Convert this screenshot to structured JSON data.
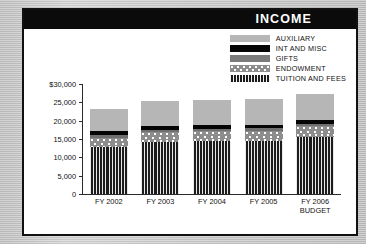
{
  "header": {
    "title": "INCOME"
  },
  "legend": {
    "items": [
      {
        "label": "AUXILIARY",
        "key": "aux",
        "color": "#b6b6b6"
      },
      {
        "label": "INT AND MISC",
        "key": "int",
        "color": "#050505"
      },
      {
        "label": "GIFTS",
        "key": "gift",
        "color": "#6f6f6f"
      },
      {
        "label": "ENDOWMENT",
        "key": "endow",
        "color": "#8d8d8d"
      },
      {
        "label": "TUITION AND FEES",
        "key": "tuition",
        "color": "#262626"
      }
    ]
  },
  "axis": {
    "y_ticks": [
      "$30,000",
      "25,000",
      "20,000",
      "15,000",
      "10,000",
      "5,000",
      "0"
    ]
  },
  "chart_data": {
    "type": "bar",
    "title": "INCOME",
    "xlabel": "",
    "ylabel": "",
    "ylim": [
      0,
      30000
    ],
    "grid": false,
    "stacked": true,
    "legend_position": "top-right",
    "categories": [
      "FY 2002",
      "FY 2003",
      "FY 2004",
      "FY 2005",
      "FY 2006 BUDGET"
    ],
    "category_lines": [
      [
        "FY 2002"
      ],
      [
        "FY 2003"
      ],
      [
        "FY 2004"
      ],
      [
        "FY 2005"
      ],
      [
        "FY 2006",
        "BUDGET"
      ]
    ],
    "series": [
      {
        "name": "TUITION AND FEES",
        "values": [
          12900,
          14300,
          14400,
          14400,
          15500
        ]
      },
      {
        "name": "ENDOWMENT",
        "values": [
          2500,
          2700,
          2800,
          2900,
          3100
        ]
      },
      {
        "name": "GIFTS",
        "values": [
          600,
          600,
          600,
          600,
          600
        ]
      },
      {
        "name": "INT AND MISC",
        "values": [
          1100,
          1000,
          1000,
          1000,
          1100
        ]
      },
      {
        "name": "AUXILIARY",
        "values": [
          6200,
          6900,
          6800,
          6900,
          7000
        ]
      }
    ],
    "totals": [
      23300,
      25500,
      25600,
      25800,
      27300
    ]
  }
}
